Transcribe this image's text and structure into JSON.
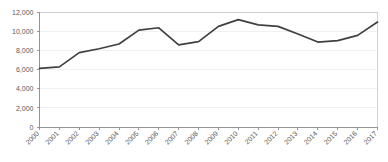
{
  "chart_data": {
    "type": "line",
    "title": "",
    "subtitle": "",
    "xlabel": "",
    "ylabel": "",
    "categories": [
      "2000",
      "2001",
      "2002",
      "2003",
      "2004",
      "2005",
      "2006",
      "2007",
      "2008",
      "2009",
      "2010",
      "2011",
      "2012",
      "2013",
      "2014",
      "2015",
      "2016",
      "2017"
    ],
    "series": [
      {
        "name": "",
        "color": "#404040",
        "values": [
          6150,
          6300,
          7800,
          8200,
          8700,
          10150,
          10400,
          8600,
          8950,
          10550,
          11250,
          10700,
          10550,
          9750,
          8900,
          9050,
          9600,
          11000
        ]
      }
    ],
    "ylim": [
      0,
      12000
    ],
    "yticks": [
      0,
      2000,
      4000,
      6000,
      8000,
      10000,
      12000
    ],
    "ytick_labels": [
      "0",
      "2,000",
      "4,000",
      "6,000",
      "8,000",
      "10,000",
      "12,000"
    ],
    "grid": true,
    "grid_axis": "y",
    "legend": false,
    "legend_position": "none",
    "xtick_rotation": -45,
    "colors": {
      "line": "#404040",
      "gridline": "#ededed",
      "frame": "#c8c8c8",
      "axis": "#8c8c8c",
      "tick_text": "#595959",
      "background": "#ffffff"
    }
  }
}
